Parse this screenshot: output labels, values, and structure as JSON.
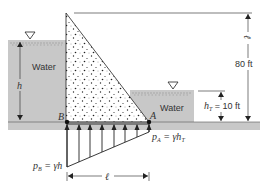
{
  "diagram": {
    "type": "dam uplift pressure figure",
    "colors": {
      "water": "#c8c8c8",
      "ground": "#c8c8c8",
      "dam_fill": "#ffffff",
      "line": "#222222",
      "text": "#333333"
    },
    "labels": {
      "left_water": "Water",
      "right_water": "Water",
      "h": "h",
      "h_T": "h",
      "h_T_sub": "T",
      "h_T_value": " = 10 ft",
      "height_value": "80 ft",
      "height_symbol": "ℓ",
      "point_B": "B",
      "point_A": "A",
      "p_B_lhs": "p",
      "p_B_sub": "B",
      "p_B_rhs": " = γh",
      "p_A_lhs": "p",
      "p_A_sub": "A",
      "p_A_rhs": " = γh",
      "p_A_rhs_sub": "T",
      "length": "ℓ"
    },
    "icons": [
      "free-surface-triangle-left",
      "free-surface-triangle-right"
    ],
    "uplift_arrows": 7
  }
}
